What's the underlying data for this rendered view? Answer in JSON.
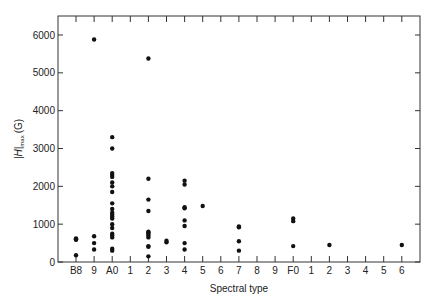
{
  "chart_data": {
    "type": "scatter",
    "title": "",
    "xlabel": "Spectral type",
    "ylabel": "|H|max (G)",
    "ylabel_main": "|H|",
    "ylabel_sub": "max",
    "ylabel_unit": "(G)",
    "x_categories": [
      "B8",
      "9",
      "A0",
      "1",
      "2",
      "3",
      "4",
      "5",
      "6",
      "7",
      "8",
      "9",
      "F0",
      "1",
      "2",
      "3",
      "4",
      "5",
      "6"
    ],
    "y_ticks": [
      0,
      1000,
      2000,
      3000,
      4000,
      5000,
      6000
    ],
    "ylim": [
      0,
      6500
    ],
    "grid": false,
    "legend": null,
    "points": [
      {
        "x": 0,
        "y": 620
      },
      {
        "x": 0,
        "y": 600
      },
      {
        "x": 0,
        "y": 590
      },
      {
        "x": 0,
        "y": 180
      },
      {
        "x": 1,
        "y": 5880
      },
      {
        "x": 1,
        "y": 680
      },
      {
        "x": 1,
        "y": 500
      },
      {
        "x": 1,
        "y": 330
      },
      {
        "x": 2,
        "y": 3300
      },
      {
        "x": 2,
        "y": 3000
      },
      {
        "x": 2,
        "y": 2350
      },
      {
        "x": 2,
        "y": 2300
      },
      {
        "x": 2,
        "y": 2250
      },
      {
        "x": 2,
        "y": 2100
      },
      {
        "x": 2,
        "y": 2000
      },
      {
        "x": 2,
        "y": 1850
      },
      {
        "x": 2,
        "y": 1550
      },
      {
        "x": 2,
        "y": 1400
      },
      {
        "x": 2,
        "y": 1300
      },
      {
        "x": 2,
        "y": 1250
      },
      {
        "x": 2,
        "y": 1200
      },
      {
        "x": 2,
        "y": 1150
      },
      {
        "x": 2,
        "y": 1000
      },
      {
        "x": 2,
        "y": 900
      },
      {
        "x": 2,
        "y": 750
      },
      {
        "x": 2,
        "y": 700
      },
      {
        "x": 2,
        "y": 650
      },
      {
        "x": 2,
        "y": 350
      },
      {
        "x": 2,
        "y": 300
      },
      {
        "x": 4,
        "y": 5380
      },
      {
        "x": 4,
        "y": 2200
      },
      {
        "x": 4,
        "y": 1650
      },
      {
        "x": 4,
        "y": 1350
      },
      {
        "x": 4,
        "y": 800
      },
      {
        "x": 4,
        "y": 780
      },
      {
        "x": 4,
        "y": 750
      },
      {
        "x": 4,
        "y": 700
      },
      {
        "x": 4,
        "y": 650
      },
      {
        "x": 4,
        "y": 420
      },
      {
        "x": 4,
        "y": 400
      },
      {
        "x": 4,
        "y": 150
      },
      {
        "x": 5,
        "y": 560
      },
      {
        "x": 5,
        "y": 520
      },
      {
        "x": 6,
        "y": 2150
      },
      {
        "x": 6,
        "y": 2050
      },
      {
        "x": 6,
        "y": 1450
      },
      {
        "x": 6,
        "y": 1420
      },
      {
        "x": 6,
        "y": 1100
      },
      {
        "x": 6,
        "y": 950
      },
      {
        "x": 6,
        "y": 500
      },
      {
        "x": 6,
        "y": 330
      },
      {
        "x": 7,
        "y": 1480
      },
      {
        "x": 9,
        "y": 940
      },
      {
        "x": 9,
        "y": 920
      },
      {
        "x": 9,
        "y": 550
      },
      {
        "x": 9,
        "y": 300
      },
      {
        "x": 12,
        "y": 1150
      },
      {
        "x": 12,
        "y": 1080
      },
      {
        "x": 12,
        "y": 420
      },
      {
        "x": 14,
        "y": 450
      },
      {
        "x": 18,
        "y": 450
      }
    ]
  },
  "colors": {
    "axis": "#333333",
    "marker": "#111111",
    "background": "#ffffff"
  }
}
